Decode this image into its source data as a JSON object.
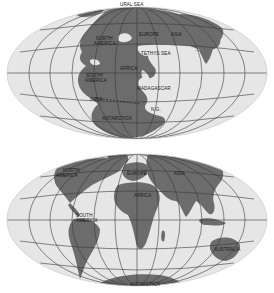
{
  "maps": [
    {
      "name": "pangaea-map",
      "labels": {
        "ural_sea": "URAL SEA",
        "north_america": "NORTH",
        "north_america_2": "AMERICA",
        "europe": "EUROPE",
        "asia": "ASIA",
        "tethys_sea": "TETHYS SEA",
        "africa": "AFRICA",
        "south_america": "SOUTH",
        "south_america_2": "AMERICA",
        "madagascar": "MADAGASCAR",
        "india": "INDIA",
        "antarctica": "ANTARCTICA",
        "new_guinea": "N.G."
      }
    },
    {
      "name": "modern-map",
      "labels": {
        "north_america": "NORTH",
        "north_america_2": "AMERICA",
        "europe": "EUROPE",
        "asia": "ASIA",
        "africa": "AFRICA",
        "south_america": "SOUTH",
        "south_america_2": "AMERICA",
        "australia": "AUSTRALIA",
        "antarctica": "ANTARCTICA"
      }
    }
  ],
  "colors": {
    "ocean": "#e8e8e8",
    "land": "#6e6e6e",
    "grid": "#3a3a3a",
    "background": "#ffffff"
  }
}
